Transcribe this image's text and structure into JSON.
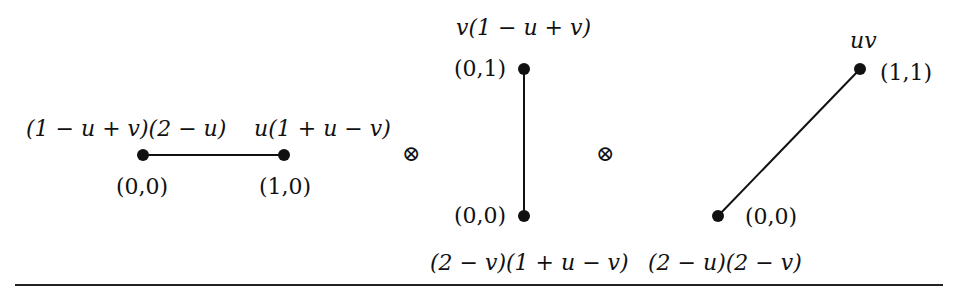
{
  "diagram": {
    "factors": [
      {
        "id": "segment-1",
        "orientation": "horizontal",
        "vertices": [
          {
            "coord": "(0,0)",
            "weight": "(1 − u + v)(2 − u)"
          },
          {
            "coord": "(1,0)",
            "weight": "u(1 + u − v)"
          }
        ]
      },
      {
        "id": "segment-2",
        "orientation": "vertical",
        "vertices": [
          {
            "coord": "(0,1)",
            "weight": "v(1 − u + v)"
          },
          {
            "coord": "(0,0)",
            "weight": "(2 − v)(1 + u − v)"
          }
        ]
      },
      {
        "id": "segment-3",
        "orientation": "diagonal",
        "vertices": [
          {
            "coord": "(1,1)",
            "weight": "uv"
          },
          {
            "coord": "(0,0)",
            "weight": "(2 − u)(2 − v)"
          }
        ]
      }
    ],
    "operators": [
      "⊗",
      "⊗"
    ],
    "colors": {
      "ink": "#111111",
      "background": "#ffffff"
    }
  }
}
